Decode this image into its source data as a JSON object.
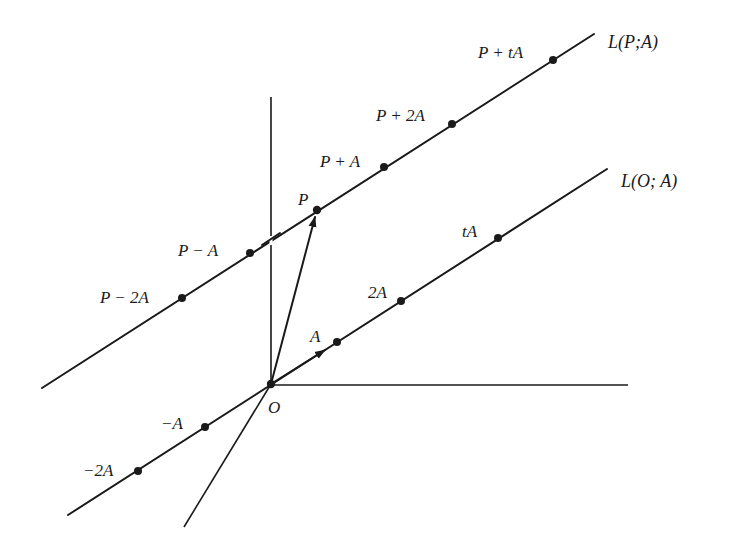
{
  "figure": {
    "line_labels": {
      "line_p": "L(P;A)",
      "line_o": "L(O; A)"
    },
    "origin_label": "O",
    "line_p_points": [
      {
        "label": "P − 2A",
        "x": 182,
        "y": 298
      },
      {
        "label": "P − A",
        "x": 250,
        "y": 253
      },
      {
        "label": "P",
        "x": 317,
        "y": 210
      },
      {
        "label": "P + A",
        "x": 384,
        "y": 167
      },
      {
        "label": "P + 2A",
        "x": 452,
        "y": 124
      },
      {
        "label": "P + tA",
        "x": 553,
        "y": 60
      }
    ],
    "line_o_points": [
      {
        "label": "−2A",
        "x": 138,
        "y": 471
      },
      {
        "label": "−A",
        "x": 205,
        "y": 427
      },
      {
        "label": "O",
        "x": 271,
        "y": 384
      },
      {
        "label": "A",
        "x": 337,
        "y": 342
      },
      {
        "label": "2A",
        "x": 401,
        "y": 301
      },
      {
        "label": "tA",
        "x": 498,
        "y": 238
      }
    ],
    "vectors": [
      {
        "name": "A",
        "from": "O",
        "to": "A"
      },
      {
        "name": "P",
        "from": "O",
        "to": "P"
      }
    ],
    "colors": {
      "ink": "#1a1a1a",
      "background": "#ffffff"
    }
  }
}
